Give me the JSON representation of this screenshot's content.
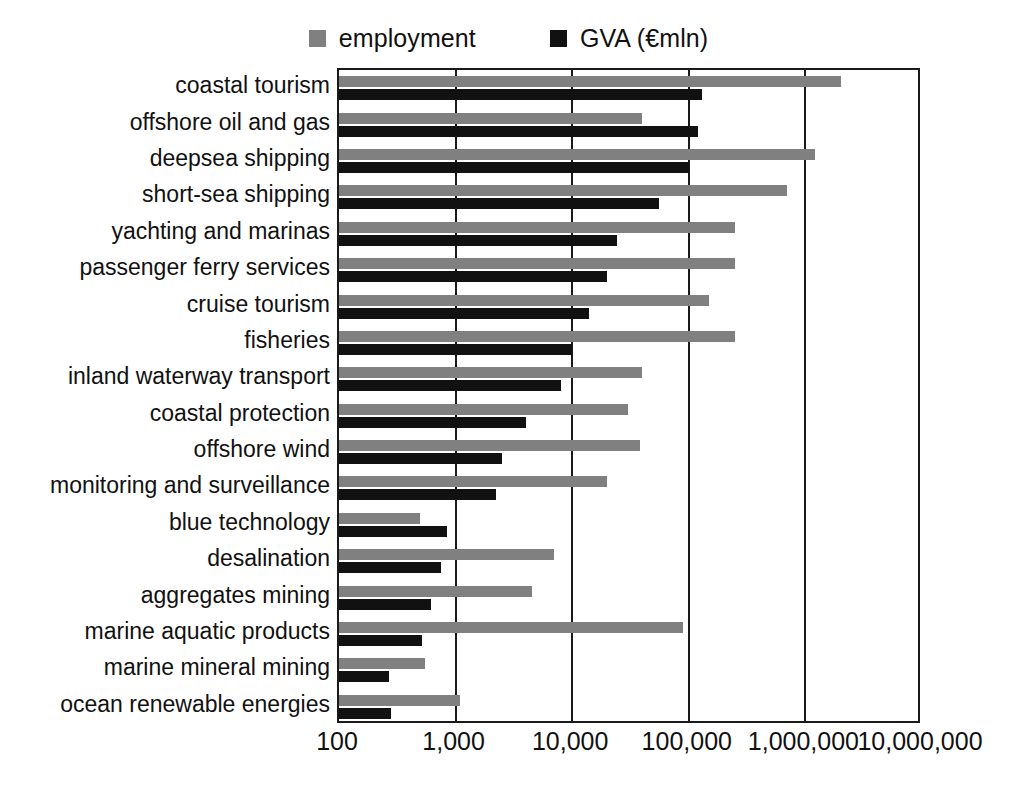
{
  "chart_data": {
    "type": "bar",
    "orientation": "horizontal",
    "title": "",
    "xlabel": "",
    "ylabel": "",
    "xscale": "log",
    "xlim": [
      100,
      10000000
    ],
    "xticks": [
      100,
      1000,
      10000,
      100000,
      1000000,
      10000000
    ],
    "xticklabels": [
      "100",
      "1,000",
      "10,000",
      "100,000",
      "1,000,000",
      "10,000,000"
    ],
    "grid": "vertical",
    "legend_position": "top-center",
    "categories": [
      "coastal tourism",
      "offshore oil and gas",
      "deepsea shipping",
      "short-sea shipping",
      "yachting and marinas",
      "passenger ferry services",
      "cruise tourism",
      "fisheries",
      "inland waterway transport",
      "coastal protection",
      "offshore wind",
      "monitoring and surveillance",
      "blue technology",
      "desalination",
      "aggregates mining",
      "marine aquatic products",
      "marine mineral mining",
      "ocean renewable energies"
    ],
    "series": [
      {
        "name": "employment",
        "color": "#808080",
        "values": [
          2000000,
          40000,
          1200000,
          700000,
          250000,
          250000,
          150000,
          250000,
          40000,
          30000,
          38000,
          20000,
          500,
          7000,
          4500,
          90000,
          550,
          1100
        ]
      },
      {
        "name": "GVA (€mln)",
        "color": "#111111",
        "values": [
          130000,
          120000,
          100000,
          55000,
          24000,
          20000,
          14000,
          10000,
          8000,
          4000,
          2500,
          2200,
          850,
          750,
          620,
          520,
          270,
          280
        ]
      }
    ]
  },
  "legend": {
    "entries": [
      {
        "label": "employment",
        "swatch": "#808080"
      },
      {
        "label": "GVA (€mln)",
        "swatch": "#111111"
      }
    ]
  }
}
